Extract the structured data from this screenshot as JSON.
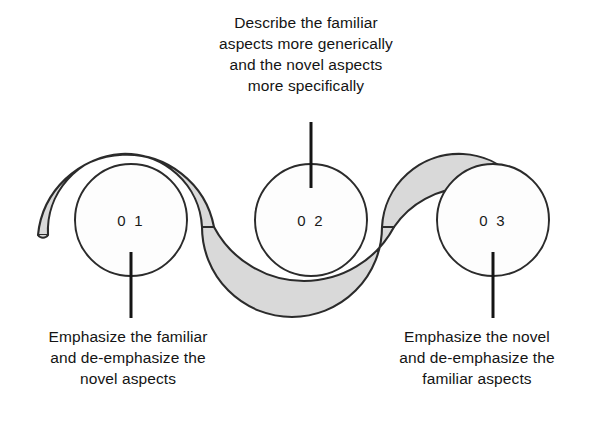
{
  "diagram": {
    "type": "three-step-wave-process",
    "background_color": "#ffffff",
    "ribbon": {
      "fill_color": "#d9d9d9",
      "stroke_color": "#2b2b2b",
      "name": "wavy-ribbon-connector"
    },
    "circle": {
      "fill_color": "#fdfdfd",
      "stroke_color": "#2b2b2b"
    },
    "leader_line_color": "#141414"
  },
  "steps": [
    {
      "number": "0 1",
      "caption": "Emphasize the familiar\nand de-emphasize the\nnovel aspects",
      "caption_position": "below"
    },
    {
      "number": "0 2",
      "caption": "Describe the familiar\naspects more generically\nand the novel aspects\nmore specifically",
      "caption_position": "above"
    },
    {
      "number": "0 3",
      "caption": "Emphasize the novel\nand de-emphasize the\nfamiliar aspects",
      "caption_position": "below"
    }
  ]
}
